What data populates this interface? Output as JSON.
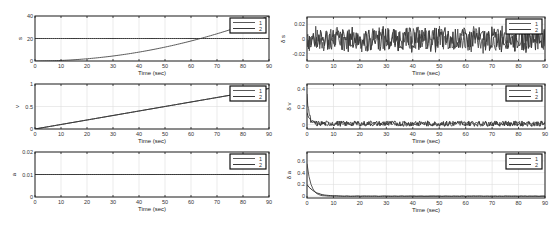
{
  "chart_data": [
    {
      "id": "s",
      "type": "line",
      "ylabel": "s",
      "xlabel": "Time (sec)",
      "xlim": [
        0,
        90
      ],
      "ylim": [
        0,
        40
      ],
      "xticks": [
        0,
        10,
        20,
        30,
        40,
        50,
        60,
        70,
        80,
        90
      ],
      "yticks": [
        0,
        20,
        40
      ],
      "yticklabels": [
        "0",
        "20",
        "40"
      ],
      "grid": true,
      "legend": [
        "1",
        "2"
      ],
      "legend_position": "northeast",
      "series": [
        {
          "name": "1",
          "kind": "quadratic",
          "x": [
            0,
            10,
            20,
            30,
            40,
            50,
            60,
            70,
            80,
            90
          ],
          "values": [
            0,
            0.4,
            2,
            4.5,
            8,
            12.5,
            18,
            24.5,
            32,
            40
          ]
        },
        {
          "name": "2",
          "kind": "constant",
          "x": [
            0,
            90
          ],
          "values": [
            20,
            20
          ]
        }
      ]
    },
    {
      "id": "v",
      "type": "line",
      "ylabel": "v",
      "xlabel": "Time (sec)",
      "xlim": [
        0,
        90
      ],
      "ylim": [
        0,
        1
      ],
      "xticks": [
        0,
        10,
        20,
        30,
        40,
        50,
        60,
        70,
        80,
        90
      ],
      "yticks": [
        0,
        0.5,
        1
      ],
      "yticklabels": [
        "0",
        "0.5",
        "1"
      ],
      "grid": true,
      "legend": [
        "1",
        "2"
      ],
      "legend_position": "northeast",
      "series": [
        {
          "name": "1",
          "kind": "linear",
          "x": [
            0,
            90
          ],
          "values": [
            0,
            0.9
          ]
        },
        {
          "name": "2",
          "kind": "linear",
          "x": [
            0,
            90
          ],
          "values": [
            0,
            0.9
          ]
        }
      ]
    },
    {
      "id": "a",
      "type": "line",
      "ylabel": "a",
      "xlabel": "Time (sec)",
      "xlim": [
        0,
        90
      ],
      "ylim": [
        0,
        0.02
      ],
      "xticks": [
        0,
        10,
        20,
        30,
        40,
        50,
        60,
        70,
        80,
        90
      ],
      "yticks": [
        0,
        0.01,
        0.02
      ],
      "yticklabels": [
        "0",
        "0.01",
        "0.02"
      ],
      "grid": true,
      "legend": [
        "1",
        "2"
      ],
      "legend_position": "northeast",
      "series": [
        {
          "name": "1",
          "kind": "constant",
          "x": [
            0,
            90
          ],
          "values": [
            0.01,
            0.01
          ]
        },
        {
          "name": "2",
          "kind": "constant",
          "x": [
            0,
            90
          ],
          "values": [
            0.01,
            0.01
          ]
        }
      ]
    },
    {
      "id": "ds",
      "type": "line",
      "ylabel": "δ s",
      "xlabel": "Time (sec)",
      "xlim": [
        0,
        90
      ],
      "ylim": [
        -0.03,
        0.03
      ],
      "xticks": [
        0,
        10,
        20,
        30,
        40,
        50,
        60,
        70,
        80,
        90
      ],
      "yticks": [
        -0.02,
        0,
        0.02
      ],
      "yticklabels": [
        "-0.02",
        "0",
        "0.02"
      ],
      "grid": true,
      "legend": [
        "1",
        "2"
      ],
      "legend_position": "northeast",
      "series": [
        {
          "name": "1",
          "kind": "noise",
          "amplitude": 0.02,
          "mean": 0
        },
        {
          "name": "2",
          "kind": "noise",
          "amplitude": 0.02,
          "mean": 0
        }
      ]
    },
    {
      "id": "dv",
      "type": "line",
      "ylabel": "δ v",
      "xlabel": "Time (sec)",
      "xlim": [
        0,
        90
      ],
      "ylim": [
        -0.05,
        0.45
      ],
      "xticks": [
        0,
        10,
        20,
        30,
        40,
        50,
        60,
        70,
        80,
        90
      ],
      "yticks": [
        0,
        0.2,
        0.4
      ],
      "yticklabels": [
        "0",
        "0.2",
        "0.4"
      ],
      "grid": true,
      "legend": [
        "1",
        "2"
      ],
      "legend_position": "northeast",
      "series": [
        {
          "name": "1",
          "kind": "decay_noise",
          "initial": 0.3,
          "amplitude": 0.03,
          "mean": 0.01
        },
        {
          "name": "2",
          "kind": "decay_noise",
          "initial": 0.15,
          "amplitude": 0.03,
          "mean": 0.01
        }
      ]
    },
    {
      "id": "da",
      "type": "line",
      "ylabel": "δ a",
      "xlabel": "Time (sec)",
      "xlim": [
        0,
        90
      ],
      "ylim": [
        -0.03,
        0.75
      ],
      "xticks": [
        0,
        10,
        20,
        30,
        40,
        50,
        60,
        70,
        80,
        90
      ],
      "yticks": [
        0,
        0.2,
        0.4,
        0.6
      ],
      "yticklabels": [
        "0",
        "0.2",
        "0.4",
        "0.6"
      ],
      "grid": true,
      "legend": [
        "1",
        "2"
      ],
      "legend_position": "northeast",
      "series": [
        {
          "name": "1",
          "kind": "decay",
          "initial": 0.55,
          "tau": 1.5,
          "amplitude": 0.005
        },
        {
          "name": "2",
          "kind": "decay",
          "initial": 0.2,
          "tau": 3,
          "amplitude": 0.005
        }
      ]
    }
  ],
  "layout": {
    "panels": [
      {
        "x": 35,
        "y": 16,
        "w": 234,
        "h": 45
      },
      {
        "x": 35,
        "y": 84,
        "w": 234,
        "h": 45
      },
      {
        "x": 35,
        "y": 152,
        "w": 234,
        "h": 45
      },
      {
        "x": 307,
        "y": 17,
        "w": 238,
        "h": 44
      },
      {
        "x": 307,
        "y": 84,
        "w": 238,
        "h": 45
      },
      {
        "x": 307,
        "y": 152,
        "w": 238,
        "h": 46
      }
    ]
  },
  "colors": {
    "line": "#555555",
    "grid": "#dddddd",
    "axis": "#222222"
  }
}
